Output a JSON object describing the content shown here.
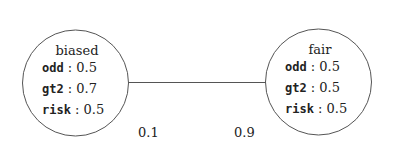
{
  "nodes": [
    {
      "id": "biased",
      "title": "biased",
      "props": [
        {
          "key": "odd",
          "sep": " : ",
          "value": "0.5"
        },
        {
          "key": "gt2",
          "sep": " : ",
          "value": "0.7"
        },
        {
          "key": "risk",
          "sep": " : ",
          "value": "0.5"
        }
      ]
    },
    {
      "id": "fair",
      "title": "fair",
      "props": [
        {
          "key": "odd",
          "sep": " : ",
          "value": "0.5"
        },
        {
          "key": "gt2",
          "sep": " : ",
          "value": "0.5"
        },
        {
          "key": "risk",
          "sep": " : ",
          "value": "0.5"
        }
      ]
    }
  ],
  "edge": {
    "from": "biased",
    "to": "fair",
    "label_from": "0.1",
    "label_to": "0.9"
  }
}
